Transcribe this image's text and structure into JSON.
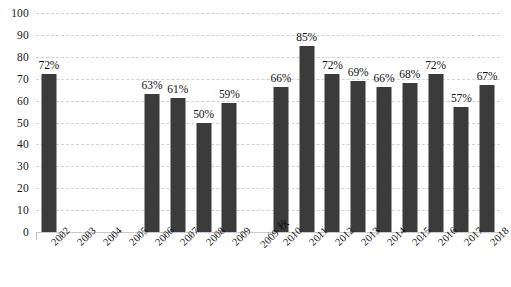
{
  "chart_data": {
    "type": "bar",
    "title": "",
    "subtitle": "",
    "xlabel": "",
    "ylabel": "",
    "ylim": [
      0,
      100
    ],
    "ytick_step": 10,
    "yticks": [
      0,
      10,
      20,
      30,
      40,
      50,
      60,
      70,
      80,
      90,
      100
    ],
    "grid": true,
    "grid_axis": "y",
    "legend": "none",
    "label_format": "{value}%",
    "categories": [
      "2002",
      "2003",
      "2004",
      "2005",
      "2006",
      "2007",
      "2008",
      "2009",
      "2009 秋",
      "2010",
      "2011",
      "2012",
      "2013",
      "2014",
      "2015",
      "2016",
      "2017",
      "2018"
    ],
    "values": [
      72,
      null,
      null,
      null,
      63,
      61,
      50,
      59,
      null,
      66,
      85,
      72,
      69,
      66,
      68,
      72,
      57,
      67
    ],
    "data_labels": [
      "72%",
      "",
      "",
      "",
      "63%",
      "61%",
      "50%",
      "59%",
      "",
      "66%",
      "85%",
      "72%",
      "69%",
      "66%",
      "68%",
      "72%",
      "57%",
      "67%"
    ],
    "missing_categories": [
      "2003",
      "2004",
      "2005",
      "2009 秋"
    ],
    "series": [
      {
        "name": "",
        "values": [
          72,
          null,
          null,
          null,
          63,
          61,
          50,
          59,
          null,
          66,
          85,
          72,
          69,
          66,
          68,
          72,
          57,
          67
        ]
      }
    ],
    "colors": {
      "bar": "#3b3b3b",
      "gridline": "#d2d2d8",
      "baseline": "#c9c9cf",
      "tick": "#b9b9bf",
      "text": "#141414",
      "background": "#ffffff"
    }
  }
}
